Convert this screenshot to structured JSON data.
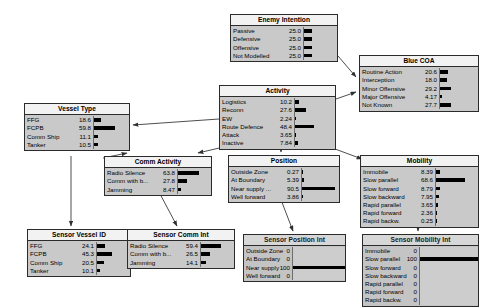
{
  "diagram": {
    "bar_color": "#000000",
    "node_fill": "#c9c9c9",
    "node_header_fill": "#f2f2f2",
    "node_border": "#2b2b2b",
    "edge_color": "#3a3a3a"
  },
  "nodes": {
    "enemy_intention": {
      "title": "Enemy Intention",
      "kind": "belief",
      "rows": [
        {
          "label": "Passive",
          "value": "25.0",
          "pct": 25.0
        },
        {
          "label": "Defensive",
          "value": "25.0",
          "pct": 25.0
        },
        {
          "label": "Offensive",
          "value": "25.0",
          "pct": 25.0
        },
        {
          "label": "Not Modelled",
          "value": "25.0",
          "pct": 25.0
        }
      ]
    },
    "blue_coa": {
      "title": "Blue COA",
      "kind": "belief",
      "rows": [
        {
          "label": "Routine Action",
          "value": "20.6",
          "pct": 20.6
        },
        {
          "label": "Interception",
          "value": "18.0",
          "pct": 18.0
        },
        {
          "label": "Minor Offensive",
          "value": "29.2",
          "pct": 29.2
        },
        {
          "label": "Major Offensive",
          "value": "4.17",
          "pct": 4.17
        },
        {
          "label": "Not Known",
          "value": "27.7",
          "pct": 27.7
        }
      ]
    },
    "activity": {
      "title": "Activity",
      "kind": "belief",
      "rows": [
        {
          "label": "Logistics",
          "value": "10.2",
          "pct": 10.2
        },
        {
          "label": "Reconn",
          "value": "27.6",
          "pct": 27.6
        },
        {
          "label": "EW",
          "value": "2.24",
          "pct": 2.24
        },
        {
          "label": "Route Defence",
          "value": "48.4",
          "pct": 48.4
        },
        {
          "label": "Attack",
          "value": "3.65",
          "pct": 3.65
        },
        {
          "label": "Inactive",
          "value": "7.84",
          "pct": 7.84
        }
      ]
    },
    "vessel_type": {
      "title": "Vessel Type",
      "kind": "belief",
      "rows": [
        {
          "label": "FFG",
          "value": "18.6",
          "pct": 18.6
        },
        {
          "label": "FCPB",
          "value": "59.8",
          "pct": 59.8
        },
        {
          "label": "Comm Ship",
          "value": "11.1",
          "pct": 11.1
        },
        {
          "label": "Tanker",
          "value": "10.5",
          "pct": 10.5
        }
      ]
    },
    "comm_activity": {
      "title": "Comm Activity",
      "kind": "belief",
      "rows": [
        {
          "label": "Radio Silence",
          "value": "63.8",
          "pct": 63.8
        },
        {
          "label": "Comm with b...",
          "value": "27.8",
          "pct": 27.8
        },
        {
          "label": "Jamming",
          "value": "8.47",
          "pct": 8.47
        }
      ]
    },
    "position": {
      "title": "Position",
      "kind": "belief",
      "rows": [
        {
          "label": "Outside Zone",
          "value": "0.27",
          "pct": 0.27
        },
        {
          "label": "At Boundary",
          "value": "5.39",
          "pct": 5.39
        },
        {
          "label": "Near supply ...",
          "value": "90.5",
          "pct": 90.5
        },
        {
          "label": "Well forward",
          "value": "3.86",
          "pct": 3.86
        }
      ]
    },
    "mobility": {
      "title": "Mobility",
      "kind": "belief",
      "rows": [
        {
          "label": "Immobile",
          "value": "8.39",
          "pct": 8.39
        },
        {
          "label": "Slow parallel",
          "value": "68.6",
          "pct": 68.6
        },
        {
          "label": "Slow forward",
          "value": "8.79",
          "pct": 8.79
        },
        {
          "label": "Slow backward",
          "value": "7.95",
          "pct": 7.95
        },
        {
          "label": "Rapid parallel",
          "value": "3.65",
          "pct": 3.65
        },
        {
          "label": "Rapid forward",
          "value": "2.36",
          "pct": 2.36
        },
        {
          "label": "Rapid backw.",
          "value": "0.25",
          "pct": 0.25
        }
      ]
    },
    "sensor_vessel_id": {
      "title": "Sensor Vessel ID",
      "kind": "belief",
      "rows": [
        {
          "label": "FFG",
          "value": "24.1",
          "pct": 24.1
        },
        {
          "label": "FCPB",
          "value": "45.3",
          "pct": 45.3
        },
        {
          "label": "Comm Ship",
          "value": "20.5",
          "pct": 20.5
        },
        {
          "label": "Tanker",
          "value": "10.1",
          "pct": 10.1
        }
      ]
    },
    "sensor_comm_int": {
      "title": "Sensor Comm Int",
      "kind": "belief",
      "rows": [
        {
          "label": "Radio Silence",
          "value": "59.4",
          "pct": 59.4
        },
        {
          "label": "Comm with b...",
          "value": "26.5",
          "pct": 26.5
        },
        {
          "label": "Jamming",
          "value": "14.1",
          "pct": 14.1
        }
      ]
    },
    "sensor_position_int": {
      "title": "Sensor Position Int",
      "kind": "evidence",
      "rows": [
        {
          "label": "Outside Zone",
          "value": "0",
          "pct": 0
        },
        {
          "label": "At Boundary",
          "value": "0",
          "pct": 0
        },
        {
          "label": "Near supply ...",
          "value": "100",
          "pct": 100
        },
        {
          "label": "Well forward",
          "value": "0",
          "pct": 0
        }
      ]
    },
    "sensor_mobility_int": {
      "title": "Sensor Mobility Int",
      "kind": "evidence",
      "rows": [
        {
          "label": "Immobile",
          "value": "0",
          "pct": 0
        },
        {
          "label": "Slow parallel",
          "value": "100",
          "pct": 100
        },
        {
          "label": "Slow forward",
          "value": "0",
          "pct": 0
        },
        {
          "label": "Slow backward",
          "value": "0",
          "pct": 0
        },
        {
          "label": "Rapid parallel",
          "value": "0",
          "pct": 0
        },
        {
          "label": "Rapid forward",
          "value": "0",
          "pct": 0
        },
        {
          "label": "Rapid backw.",
          "value": "0",
          "pct": 0
        }
      ]
    }
  },
  "edges": [
    {
      "from": "enemy_intention",
      "to": "blue_coa"
    },
    {
      "from": "activity",
      "to": "blue_coa"
    },
    {
      "from": "activity",
      "to": "vessel_type"
    },
    {
      "from": "activity",
      "to": "comm_activity"
    },
    {
      "from": "activity",
      "to": "position"
    },
    {
      "from": "activity",
      "to": "mobility"
    },
    {
      "from": "vessel_type",
      "to": "comm_activity"
    },
    {
      "from": "vessel_type",
      "to": "sensor_vessel_id"
    },
    {
      "from": "comm_activity",
      "to": "sensor_comm_int"
    },
    {
      "from": "position",
      "to": "sensor_position_int"
    },
    {
      "from": "mobility",
      "to": "sensor_mobility_int"
    }
  ]
}
